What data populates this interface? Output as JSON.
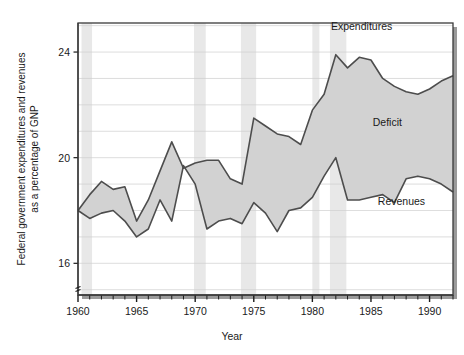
{
  "chart_data": {
    "type": "area",
    "title": "",
    "xlabel": "Year",
    "ylabel": "Federal government expenditures and revenues as a percentage of GNP",
    "xlim": [
      1960,
      1992
    ],
    "ylim": [
      14.8,
      25.1
    ],
    "xticks": [
      1960,
      1965,
      1970,
      1975,
      1980,
      1985,
      1990
    ],
    "xtick_labels": [
      "1960",
      "1965",
      "1970",
      "1975",
      "1980",
      "1985",
      "1990"
    ],
    "minor_xtick_step": 1,
    "yticks": [
      16,
      20,
      24
    ],
    "ytick_labels": [
      "16",
      "20",
      "24"
    ],
    "grid": true,
    "grid_step": 1,
    "legend_position": "inline-annotations",
    "annotations": [
      {
        "text": "Expenditures",
        "x": 1984.2,
        "y": 24.85
      },
      {
        "text": "Deficit",
        "x": 1986.4,
        "y": 21.2
      },
      {
        "text": "Revenues",
        "x": 1987.6,
        "y": 18.2
      }
    ],
    "fill_label": "Deficit",
    "fill_color": "#d2d2d2",
    "line_color": "#4d4d4d",
    "recession_band_color": "#e8e8e8",
    "recession_bands": [
      {
        "start": 1960.3,
        "end": 1961.2
      },
      {
        "start": 1969.9,
        "end": 1970.9
      },
      {
        "start": 1973.9,
        "end": 1975.2
      },
      {
        "start": 1980.0,
        "end": 1980.6
      },
      {
        "start": 1981.5,
        "end": 1982.9
      }
    ],
    "x": [
      1960,
      1961,
      1962,
      1963,
      1964,
      1965,
      1966,
      1967,
      1968,
      1969,
      1970,
      1971,
      1972,
      1973,
      1974,
      1975,
      1976,
      1977,
      1978,
      1979,
      1980,
      1981,
      1982,
      1983,
      1984,
      1985,
      1986,
      1987,
      1988,
      1989,
      1990,
      1991,
      1992
    ],
    "series": [
      {
        "name": "Expenditures",
        "values": [
          18.0,
          18.6,
          19.1,
          18.8,
          18.9,
          17.6,
          18.4,
          19.5,
          20.6,
          19.6,
          19.8,
          19.9,
          19.9,
          19.2,
          19.0,
          21.5,
          21.2,
          20.9,
          20.8,
          20.5,
          21.8,
          22.4,
          23.9,
          23.4,
          23.8,
          23.7,
          23.0,
          22.7,
          22.5,
          22.4,
          22.6,
          22.9,
          23.1
        ]
      },
      {
        "name": "Revenues",
        "values": [
          18.0,
          17.7,
          17.9,
          18.0,
          17.6,
          17.0,
          17.3,
          18.4,
          17.6,
          19.7,
          19.0,
          17.3,
          17.6,
          17.7,
          17.5,
          18.3,
          17.9,
          17.2,
          18.0,
          18.1,
          18.5,
          19.3,
          20.0,
          18.4,
          18.4,
          18.5,
          18.6,
          18.3,
          19.2,
          19.3,
          19.2,
          19.0,
          18.7
        ]
      }
    ]
  },
  "frame": {
    "shadow_color": "#9a9a9a",
    "border_color": "#3a3a3a",
    "background": "#ffffff"
  }
}
